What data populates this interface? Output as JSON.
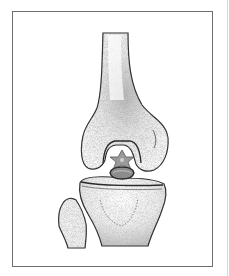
{
  "illustration": {
    "subject": "knee joint anatomy",
    "parts": [
      "femur",
      "tibia",
      "fibula",
      "intercondylar star marker",
      "ligament"
    ],
    "colors": {
      "outline": "#2a2a2a",
      "shading": "#8a8a8a",
      "bone_fill": "#f4f4f4",
      "marker": "#7a7a7a",
      "frame": "#6e6e6e",
      "background": "#ffffff"
    }
  }
}
